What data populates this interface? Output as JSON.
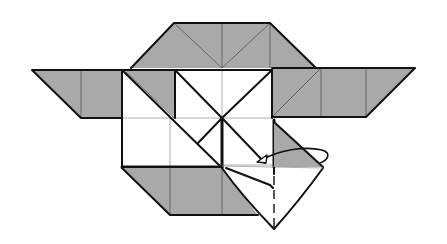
{
  "diagram": {
    "type": "origami-folding-step",
    "colors": {
      "shaded_flap": "#a9a9a9",
      "paper": "#ffffff",
      "lines": "#111111"
    },
    "parts": [
      {
        "id": "top-flap",
        "shape": "trapezoid",
        "shading": "gray"
      },
      {
        "id": "left-wing",
        "shape": "parallelogram",
        "shading": "gray"
      },
      {
        "id": "right-wing",
        "shape": "parallelogram",
        "shading": "gray"
      },
      {
        "id": "bottom-flap",
        "shape": "parallelogram",
        "shading": "gray"
      },
      {
        "id": "center-square",
        "shape": "square-grid",
        "shading": "white"
      },
      {
        "id": "folding-corner",
        "shape": "kite",
        "shading": "white"
      },
      {
        "id": "fold-arrow",
        "shape": "looping-arrow",
        "meaning": "fold flap behind / swivel"
      }
    ],
    "annotations": []
  }
}
